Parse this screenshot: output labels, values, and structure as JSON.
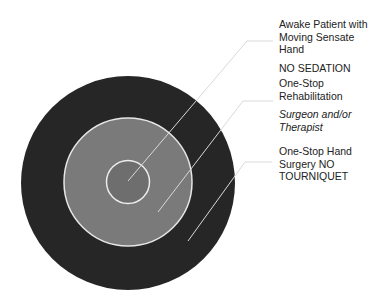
{
  "diagram": {
    "type": "concentric-circles",
    "colors": {
      "outer": "#262626",
      "middle": "#7a7a7a",
      "inner": "#6e6e6e",
      "ring_stroke": "#e6e6e6",
      "leader": "#d9d9d9"
    },
    "rings": [
      {
        "id": "inner",
        "title_lines": [
          "Awake Patient with",
          "Moving Sensate",
          "Hand"
        ],
        "subtitle": "NO SEDATION",
        "subtitle_style": "normal"
      },
      {
        "id": "middle",
        "title_lines": [
          "One-Stop",
          "Rehabilitation"
        ],
        "subtitle_lines": [
          "Surgeon and/or",
          "Therapist"
        ],
        "subtitle_style": "italic"
      },
      {
        "id": "outer",
        "title_lines": [
          "One-Stop Hand",
          "Surgery NO",
          "TOURNIQUET"
        ]
      }
    ]
  }
}
